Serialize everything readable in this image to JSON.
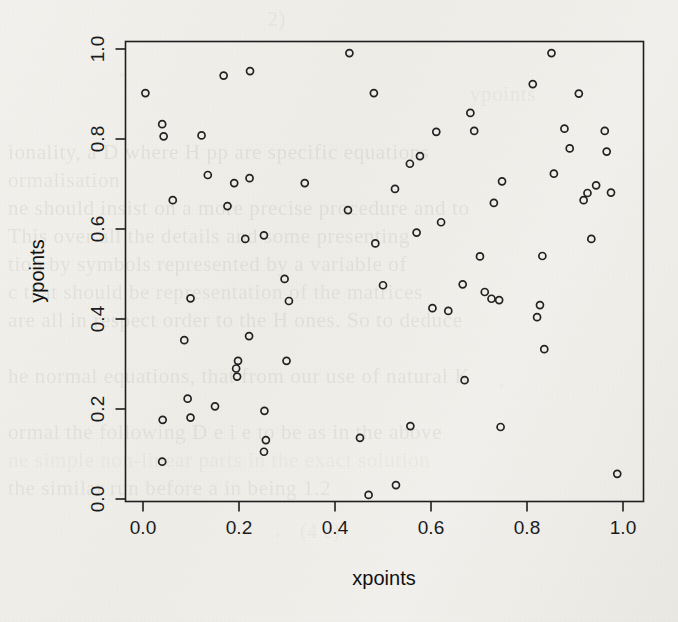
{
  "chart_data": {
    "type": "scatter",
    "title": "",
    "xlabel": "xpoints",
    "ylabel": "ypoints",
    "xlim": [
      0.0,
      1.0
    ],
    "ylim": [
      0.0,
      1.0
    ],
    "xticks": [
      "0.0",
      "0.2",
      "0.4",
      "0.6",
      "0.8",
      "1.0"
    ],
    "yticks": [
      "0.0",
      "0.2",
      "0.4",
      "0.6",
      "0.8",
      "1.0"
    ],
    "xtick_values": [
      0.0,
      0.2,
      0.4,
      0.6,
      0.8,
      1.0
    ],
    "ytick_values": [
      0.0,
      0.2,
      0.4,
      0.6,
      0.8,
      1.0
    ],
    "grid": false,
    "legend": null,
    "marker": "open-circle",
    "marker_size": 7,
    "marker_color": "#222222",
    "box": true,
    "n_points": 68,
    "points": [
      [
        0.005,
        0.902
      ],
      [
        0.04,
        0.833
      ],
      [
        0.043,
        0.806
      ],
      [
        0.062,
        0.664
      ],
      [
        0.041,
        0.176
      ],
      [
        0.04,
        0.083
      ],
      [
        0.086,
        0.353
      ],
      [
        0.093,
        0.223
      ],
      [
        0.099,
        0.446
      ],
      [
        0.099,
        0.181
      ],
      [
        0.122,
        0.808
      ],
      [
        0.135,
        0.72
      ],
      [
        0.15,
        0.206
      ],
      [
        0.168,
        0.941
      ],
      [
        0.176,
        0.651
      ],
      [
        0.19,
        0.702
      ],
      [
        0.194,
        0.29
      ],
      [
        0.198,
        0.307
      ],
      [
        0.196,
        0.272
      ],
      [
        0.213,
        0.578
      ],
      [
        0.223,
        0.951
      ],
      [
        0.222,
        0.713
      ],
      [
        0.221,
        0.362
      ],
      [
        0.252,
        0.586
      ],
      [
        0.253,
        0.196
      ],
      [
        0.256,
        0.131
      ],
      [
        0.252,
        0.105
      ],
      [
        0.295,
        0.489
      ],
      [
        0.299,
        0.307
      ],
      [
        0.304,
        0.44
      ],
      [
        0.337,
        0.702
      ],
      [
        0.43,
        0.991
      ],
      [
        0.427,
        0.642
      ],
      [
        0.452,
        0.136
      ],
      [
        0.47,
        0.009
      ],
      [
        0.481,
        0.902
      ],
      [
        0.484,
        0.568
      ],
      [
        0.5,
        0.475
      ],
      [
        0.525,
        0.689
      ],
      [
        0.527,
        0.031
      ],
      [
        0.556,
        0.745
      ],
      [
        0.557,
        0.162
      ],
      [
        0.57,
        0.592
      ],
      [
        0.577,
        0.762
      ],
      [
        0.603,
        0.424
      ],
      [
        0.611,
        0.816
      ],
      [
        0.621,
        0.615
      ],
      [
        0.636,
        0.418
      ],
      [
        0.666,
        0.477
      ],
      [
        0.67,
        0.264
      ],
      [
        0.682,
        0.858
      ],
      [
        0.69,
        0.818
      ],
      [
        0.702,
        0.539
      ],
      [
        0.712,
        0.46
      ],
      [
        0.726,
        0.445
      ],
      [
        0.731,
        0.658
      ],
      [
        0.742,
        0.442
      ],
      [
        0.745,
        0.16
      ],
      [
        0.748,
        0.706
      ],
      [
        0.812,
        0.922
      ],
      [
        0.821,
        0.404
      ],
      [
        0.827,
        0.431
      ],
      [
        0.832,
        0.54
      ],
      [
        0.836,
        0.333
      ],
      [
        0.851,
        0.991
      ],
      [
        0.856,
        0.723
      ],
      [
        0.878,
        0.823
      ],
      [
        0.889,
        0.779
      ],
      [
        0.908,
        0.901
      ],
      [
        0.918,
        0.664
      ],
      [
        0.926,
        0.68
      ],
      [
        0.934,
        0.578
      ],
      [
        0.944,
        0.697
      ],
      [
        0.962,
        0.818
      ],
      [
        0.966,
        0.772
      ],
      [
        0.975,
        0.681
      ],
      [
        0.988,
        0.056
      ]
    ]
  },
  "axes": {
    "x_title": "xpoints",
    "y_title": "ypoints"
  },
  "background": {
    "kind": "scanned-book-page",
    "ghost_lines": [
      {
        "text": "2)",
        "x": 268,
        "y": 8,
        "size": 20,
        "opacity": 0.3
      },
      {
        "text": "ypoints",
        "x": 470,
        "y": 82,
        "size": 21,
        "opacity": 0.26
      },
      {
        "text": "ionality, a  D  where  H  pp  are  specific  equations",
        "x": 8,
        "y": 140,
        "size": 21,
        "opacity": 0.4
      },
      {
        "text": "ormalisation",
        "x": 8,
        "y": 168,
        "size": 21,
        "opacity": 0.34
      },
      {
        "text": "ne should  insist  on  a  more  precise  procedure  and to",
        "x": 8,
        "y": 196,
        "size": 21,
        "opacity": 0.4
      },
      {
        "text": "This  over  all  the  details  and   some  presenting",
        "x": 8,
        "y": 224,
        "size": 21,
        "opacity": 0.38
      },
      {
        "text": "tion  by  symbols  represented  by  a  variable  of",
        "x": 8,
        "y": 252,
        "size": 21,
        "opacity": 0.38
      },
      {
        "text": "c  that  should  be  representation  of  the  matrices",
        "x": 8,
        "y": 280,
        "size": 21,
        "opacity": 0.36
      },
      {
        "text": "are  all  in  respect  order  to  the  H  ones.   So  to  deduce",
        "x": 8,
        "y": 308,
        "size": 21,
        "opacity": 0.38
      },
      {
        "text": "he  normal  equations,   that  from  our  use  of  natural  K",
        "x": 8,
        "y": 364,
        "size": 21,
        "opacity": 0.38
      },
      {
        "text": "ormal  the  following  D  e  i  e  to  be  as  in  the  above",
        "x": 8,
        "y": 420,
        "size": 21,
        "opacity": 0.36
      },
      {
        "text": "ne  simple  non-linear  parts  in  the  exact  solution",
        "x": 8,
        "y": 448,
        "size": 21,
        "opacity": 0.2
      },
      {
        "text": "the  similar  run  before   a  in  being  1.2",
        "x": 8,
        "y": 476,
        "size": 21,
        "opacity": 0.34
      },
      {
        "text": "(4  e)",
        "x": 300,
        "y": 520,
        "size": 20,
        "opacity": 0.22
      }
    ]
  }
}
